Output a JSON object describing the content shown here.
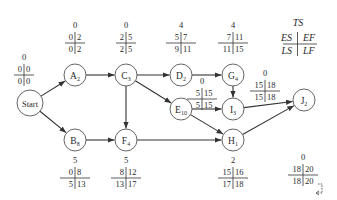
{
  "legend": {
    "ts": "TS",
    "es": "ES",
    "ef": "EF",
    "ls": "LS",
    "lf": "LF"
  },
  "colors": {
    "line": "#333333",
    "circle_stroke": "#555555",
    "text": "#2a2a2a",
    "background": "#ffffff"
  },
  "nodes": [
    {
      "id": "start",
      "label": "Start",
      "sub": "",
      "cx": 30,
      "cy": 103,
      "r": 13,
      "ts": "0",
      "es": "0",
      "ef": "0",
      "ls": "0",
      "lf": "0",
      "tx": 24,
      "ty": 60
    },
    {
      "id": "A",
      "label": "A",
      "sub": "2",
      "cx": 75,
      "cy": 75,
      "r": 11,
      "ts": "0",
      "es": "0",
      "ef": "2",
      "ls": "0",
      "lf": "2",
      "tx": 75,
      "ty": 28
    },
    {
      "id": "C",
      "label": "C",
      "sub": "3",
      "cx": 126,
      "cy": 75,
      "r": 11,
      "ts": "0",
      "es": "2",
      "ef": "5",
      "ls": "2",
      "lf": "5",
      "tx": 126,
      "ty": 28
    },
    {
      "id": "D",
      "label": "D",
      "sub": "2",
      "cx": 181,
      "cy": 75,
      "r": 11,
      "ts": "4",
      "es": "5",
      "ef": "7",
      "ls": "9",
      "lf": "11",
      "tx": 181,
      "ty": 28
    },
    {
      "id": "G",
      "label": "G",
      "sub": "4",
      "cx": 233,
      "cy": 75,
      "r": 11,
      "ts": "4",
      "es": "7",
      "ef": "11",
      "ls": "11",
      "lf": "15",
      "tx": 233,
      "ty": 28
    },
    {
      "id": "E",
      "label": "E",
      "sub": "10",
      "cx": 181,
      "cy": 109,
      "r": 11,
      "ts": "0",
      "es": "5",
      "ef": "15",
      "ls": "5",
      "lf": "15",
      "tx": 202,
      "ty": 84
    },
    {
      "id": "I",
      "label": "I",
      "sub": "3",
      "cx": 233,
      "cy": 109,
      "r": 11,
      "ts": "0",
      "es": "15",
      "ef": "18",
      "ls": "15",
      "lf": "18",
      "tx": 265,
      "ty": 76
    },
    {
      "id": "J",
      "label": "J",
      "sub": "2",
      "cx": 304,
      "cy": 100,
      "r": 11,
      "ts": "0",
      "es": "18",
      "ef": "20",
      "ls": "18",
      "lf": "20",
      "tx": 303,
      "ty": 160
    },
    {
      "id": "B",
      "label": "B",
      "sub": "8",
      "cx": 75,
      "cy": 140,
      "r": 11,
      "ts": "5",
      "es": "0",
      "ef": "8",
      "ls": "5",
      "lf": "13",
      "tx": 75,
      "ty": 163
    },
    {
      "id": "F",
      "label": "F",
      "sub": "4",
      "cx": 126,
      "cy": 140,
      "r": 11,
      "ts": "5",
      "es": "8",
      "ef": "12",
      "ls": "13",
      "lf": "17",
      "tx": 126,
      "ty": 163
    },
    {
      "id": "H",
      "label": "H",
      "sub": "1",
      "cx": 233,
      "cy": 140,
      "r": 11,
      "ts": "2",
      "es": "15",
      "ef": "16",
      "ls": "17",
      "lf": "18",
      "tx": 233,
      "ty": 163
    }
  ],
  "edges": [
    {
      "from": "start",
      "to": "A"
    },
    {
      "from": "start",
      "to": "B"
    },
    {
      "from": "A",
      "to": "C"
    },
    {
      "from": "B",
      "to": "F"
    },
    {
      "from": "C",
      "to": "D"
    },
    {
      "from": "C",
      "to": "E"
    },
    {
      "from": "C",
      "to": "F"
    },
    {
      "from": "D",
      "to": "G"
    },
    {
      "from": "G",
      "to": "I"
    },
    {
      "from": "E",
      "to": "I"
    },
    {
      "from": "E",
      "to": "H"
    },
    {
      "from": "F",
      "to": "H"
    },
    {
      "from": "I",
      "to": "J"
    },
    {
      "from": "H",
      "to": "J"
    }
  ]
}
